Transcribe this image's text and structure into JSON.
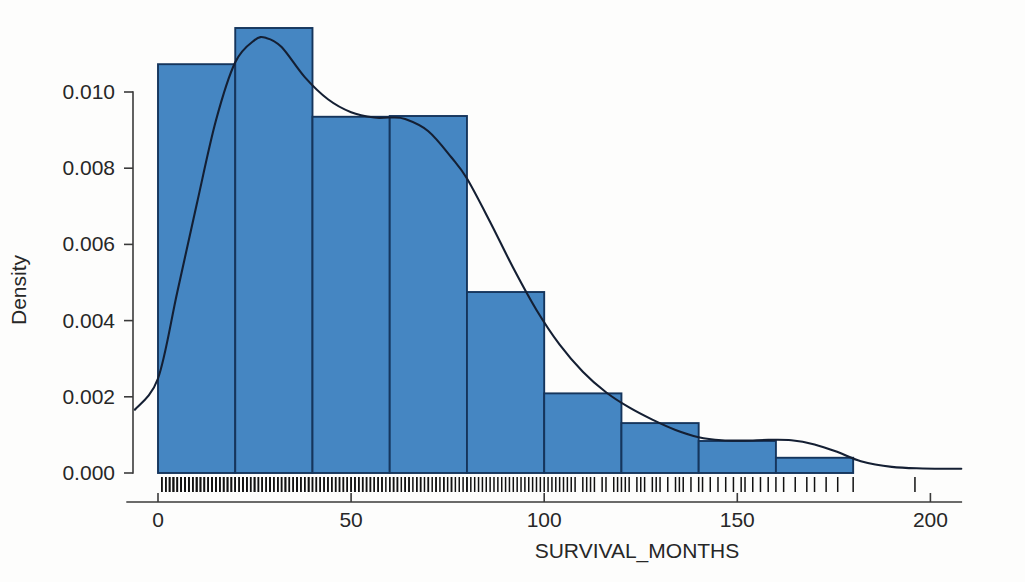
{
  "chart_data": {
    "type": "bar",
    "title": "",
    "subtitle": "",
    "xlabel": "SURVIVAL_MONTHS",
    "ylabel": "Density",
    "xlim": [
      -8,
      208
    ],
    "ylim": [
      0.0,
      0.0125
    ],
    "xticks": [
      0,
      50,
      100,
      150,
      200
    ],
    "xtick_labels": [
      "0",
      "50",
      "100",
      "150",
      "200"
    ],
    "yticks": [
      0.0,
      0.002,
      0.004,
      0.006,
      0.008,
      0.01
    ],
    "ytick_labels": [
      "0.000",
      "0.002",
      "0.004",
      "0.006",
      "0.008",
      "0.010"
    ],
    "grid": false,
    "legend": false,
    "legend_position": "none",
    "bin_width": 20,
    "bin_edges": [
      0,
      20,
      40,
      60,
      80,
      100,
      120,
      140,
      160,
      180
    ],
    "categories": [
      "0-20",
      "20-40",
      "40-60",
      "60-80",
      "80-100",
      "100-120",
      "120-140",
      "140-160",
      "160-180"
    ],
    "values": [
      0.01073,
      0.01168,
      0.00935,
      0.00937,
      0.00475,
      0.00209,
      0.00131,
      0.00084,
      0.0004
    ],
    "bar_color": "#4586c2",
    "bar_edge_color": "#15355c",
    "series": [
      {
        "name": "Density (KDE)",
        "type": "line",
        "color": "#141f33",
        "x": [
          -6,
          0,
          5,
          10,
          15,
          20,
          25,
          28,
          32,
          38,
          44,
          50,
          56,
          60,
          64,
          70,
          76,
          80,
          86,
          92,
          98,
          104,
          110,
          116,
          122,
          128,
          134,
          140,
          146,
          152,
          158,
          164,
          170,
          176,
          182,
          190,
          198,
          208
        ],
        "y": [
          0.00166,
          0.00248,
          0.00475,
          0.00704,
          0.00925,
          0.01078,
          0.01136,
          0.01142,
          0.01118,
          0.01039,
          0.00981,
          0.00947,
          0.00933,
          0.00933,
          0.00929,
          0.00897,
          0.00828,
          0.00773,
          0.00659,
          0.00538,
          0.00428,
          0.00337,
          0.00266,
          0.00212,
          0.00172,
          0.0014,
          0.00113,
          0.00094,
          0.00086,
          0.00085,
          0.00087,
          0.00086,
          0.00075,
          0.00055,
          0.00031,
          0.00016,
          0.00012,
          0.00011
        ]
      }
    ],
    "rug": {
      "present": true,
      "color": "#111111",
      "note": "dense rug of individual observations along x-axis baseline",
      "values": [
        1,
        1,
        2,
        2,
        2,
        3,
        3,
        3,
        4,
        4,
        4,
        4,
        5,
        5,
        5,
        6,
        6,
        6,
        6,
        7,
        7,
        7,
        8,
        8,
        8,
        9,
        9,
        9,
        10,
        10,
        10,
        10,
        11,
        11,
        11,
        12,
        12,
        12,
        13,
        13,
        13,
        14,
        14,
        14,
        15,
        15,
        15,
        16,
        16,
        16,
        17,
        17,
        17,
        18,
        18,
        18,
        19,
        19,
        19,
        20,
        20,
        20,
        21,
        21,
        22,
        22,
        22,
        23,
        23,
        23,
        24,
        24,
        25,
        25,
        25,
        26,
        26,
        27,
        27,
        27,
        28,
        28,
        29,
        29,
        29,
        30,
        30,
        31,
        31,
        31,
        32,
        32,
        33,
        33,
        33,
        34,
        34,
        35,
        35,
        36,
        36,
        36,
        37,
        37,
        38,
        38,
        39,
        39,
        39,
        40,
        40,
        41,
        41,
        42,
        42,
        43,
        43,
        44,
        44,
        45,
        45,
        46,
        46,
        47,
        47,
        48,
        48,
        49,
        49,
        50,
        50,
        51,
        51,
        52,
        52,
        53,
        53,
        54,
        54,
        55,
        55,
        56,
        56,
        57,
        57,
        58,
        58,
        59,
        60,
        60,
        61,
        61,
        62,
        62,
        63,
        64,
        64,
        65,
        65,
        66,
        67,
        67,
        68,
        68,
        69,
        70,
        70,
        71,
        72,
        72,
        73,
        74,
        74,
        75,
        76,
        76,
        77,
        78,
        79,
        80,
        80,
        81,
        82,
        83,
        84,
        85,
        86,
        87,
        88,
        89,
        90,
        91,
        92,
        93,
        94,
        95,
        96,
        97,
        98,
        99,
        100,
        101,
        102,
        103,
        104,
        105,
        106,
        107,
        108,
        110,
        111,
        112,
        113,
        115,
        116,
        118,
        119,
        120,
        121,
        122,
        124,
        125,
        126,
        128,
        129,
        130,
        132,
        134,
        135,
        136,
        138,
        140,
        141,
        143,
        145,
        147,
        149,
        151,
        152,
        154,
        156,
        158,
        160,
        162,
        165,
        168,
        170,
        173,
        176,
        180,
        196
      ]
    }
  },
  "axes": {
    "ytick_labels": [
      "0.010",
      "0.008",
      "0.006",
      "0.004",
      "0.002",
      "0.000"
    ],
    "xtick_labels": [
      "0",
      "50",
      "100",
      "150",
      "200"
    ],
    "xlabel": "SURVIVAL_MONTHS",
    "ylabel": "Density"
  }
}
